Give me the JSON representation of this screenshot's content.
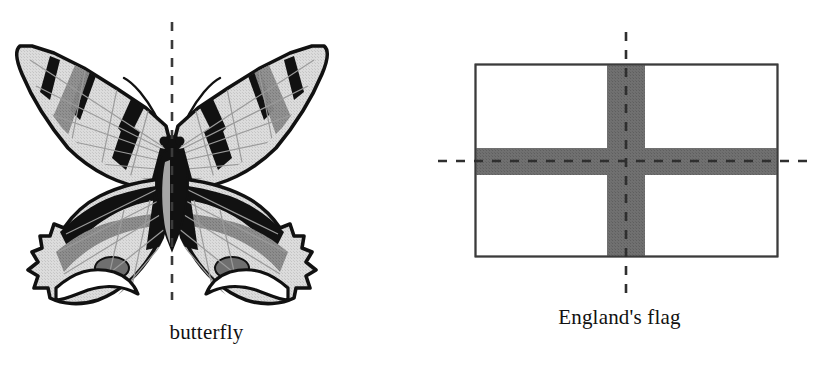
{
  "figure": {
    "background_color": "#ffffff",
    "width": 826,
    "height": 368
  },
  "panels": [
    {
      "id": "butterfly",
      "caption": "butterfly",
      "subject": "swallowtail-butterfly",
      "symmetry_lines": [
        {
          "orientation": "vertical",
          "label": "vertical-axis-of-symmetry",
          "x": 172,
          "y_start": 22,
          "y_end": 300,
          "style": "dashed",
          "color": "#3a3a3a"
        }
      ],
      "colors": {
        "outline": "#111111",
        "wing_light": "#d6d6d6",
        "wing_mid": "#8a8a8a",
        "wing_dark": "#111111",
        "vein": "#9a9a9a"
      }
    },
    {
      "id": "flag",
      "caption": "England's flag",
      "subject": "england-flag-st-george-cross",
      "rect": {
        "x": 475,
        "y": 64,
        "width": 303,
        "height": 193
      },
      "cross": {
        "vertical_bar": {
          "x": 607,
          "width": 38
        },
        "horizontal_bar": {
          "y": 148,
          "height": 27
        },
        "fill_color": "#6e6e6e"
      },
      "border_color": "#3b3b3b",
      "field_color": "#ffffff",
      "symmetry_lines": [
        {
          "orientation": "vertical",
          "label": "vertical-axis-of-symmetry",
          "x": 626,
          "y_start": 32,
          "y_end": 296,
          "style": "dashed",
          "color": "#2f2f2f"
        },
        {
          "orientation": "horizontal",
          "label": "horizontal-axis-of-symmetry",
          "y": 161,
          "x_start": 438,
          "x_end": 816,
          "style": "dashed",
          "color": "#2f2f2f"
        }
      ]
    }
  ]
}
